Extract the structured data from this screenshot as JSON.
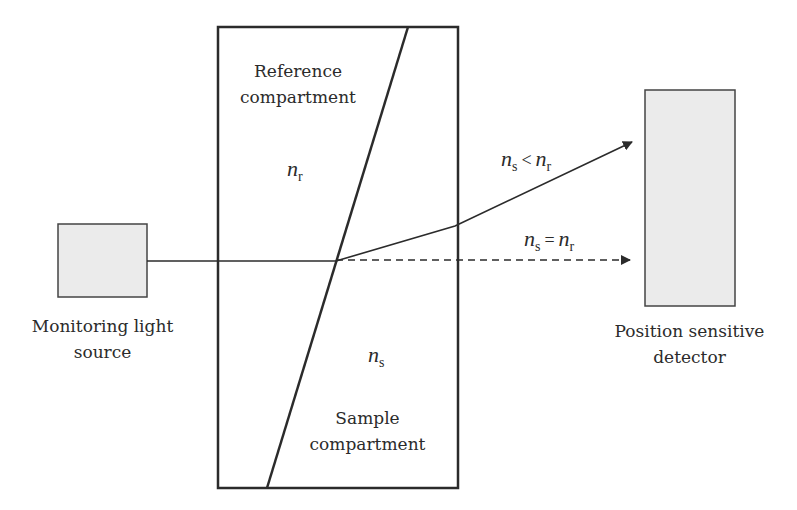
{
  "diagram": {
    "type": "optical refractometer schematic",
    "colors": {
      "stroke": "#2b2b2b",
      "box_fill": "#ebebeb",
      "background": "#ffffff"
    },
    "light_source": {
      "label_line1": "Monitoring light",
      "label_line2": "source"
    },
    "cell": {
      "reference": {
        "label_line1": "Reference",
        "label_line2": "compartment",
        "index_symbol": "n",
        "index_sub": "r"
      },
      "sample": {
        "label_line1": "Sample",
        "label_line2": "compartment",
        "index_symbol": "n",
        "index_sub": "s"
      }
    },
    "rays": {
      "deflected": {
        "condition_lhs": "n",
        "condition_lhs_sub": "s",
        "operator": "<",
        "condition_rhs": "n",
        "condition_rhs_sub": "r",
        "style": "solid"
      },
      "straight": {
        "condition_lhs": "n",
        "condition_lhs_sub": "s",
        "operator": "=",
        "condition_rhs": "n",
        "condition_rhs_sub": "r",
        "style": "dashed"
      }
    },
    "detector": {
      "label_line1": "Position sensitive",
      "label_line2": "detector"
    }
  }
}
